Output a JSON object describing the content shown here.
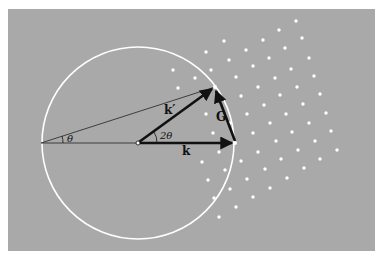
{
  "diagram": {
    "colors": {
      "background": "#a9a9a9",
      "page": "#ffffff",
      "circle": "#ffffff",
      "dots": "#ffffff",
      "vectors": "#111111"
    },
    "panel": {
      "x": 8,
      "y": 9,
      "w": 367,
      "h": 242
    },
    "circle": {
      "cx": 138,
      "cy": 143,
      "r": 96
    },
    "points": {
      "left": [
        41,
        143
      ],
      "origin": [
        138,
        143
      ],
      "k_tip": [
        235,
        143
      ],
      "kprime_tip": [
        215,
        87
      ]
    },
    "labels": {
      "k": "k",
      "k_prime": "k′",
      "G": "G",
      "theta": "θ",
      "two_theta": "2θ"
    },
    "lattice_points": [
      [
        296,
        21
      ],
      [
        279,
        30
      ],
      [
        224,
        41
      ],
      [
        263,
        40
      ],
      [
        302,
        38
      ],
      [
        206,
        52
      ],
      [
        246,
        50
      ],
      [
        285,
        48
      ],
      [
        229,
        60
      ],
      [
        269,
        58
      ],
      [
        309,
        58
      ],
      [
        173,
        70
      ],
      [
        211,
        70
      ],
      [
        253,
        66
      ],
      [
        291,
        69
      ],
      [
        195,
        78
      ],
      [
        236,
        77
      ],
      [
        275,
        78
      ],
      [
        314,
        76
      ],
      [
        178,
        88
      ],
      [
        258,
        87
      ],
      [
        297,
        87
      ],
      [
        241,
        96
      ],
      [
        280,
        95
      ],
      [
        320,
        94
      ],
      [
        264,
        105
      ],
      [
        303,
        104
      ],
      [
        206,
        114
      ],
      [
        247,
        114
      ],
      [
        286,
        114
      ],
      [
        326,
        113
      ],
      [
        230,
        123
      ],
      [
        270,
        123
      ],
      [
        309,
        123
      ],
      [
        213,
        133
      ],
      [
        253,
        133
      ],
      [
        292,
        132
      ],
      [
        331,
        131
      ],
      [
        276,
        141
      ],
      [
        315,
        141
      ],
      [
        219,
        152
      ],
      [
        258,
        152
      ],
      [
        298,
        150
      ],
      [
        337,
        150
      ],
      [
        202,
        162
      ],
      [
        241,
        161
      ],
      [
        281,
        159
      ],
      [
        320,
        159
      ],
      [
        225,
        170
      ],
      [
        265,
        169
      ],
      [
        304,
        168
      ],
      [
        208,
        180
      ],
      [
        247,
        179
      ],
      [
        287,
        178
      ],
      [
        230,
        189
      ],
      [
        270,
        188
      ],
      [
        214,
        198
      ],
      [
        253,
        197
      ],
      [
        236,
        207
      ],
      [
        219,
        217
      ]
    ]
  }
}
